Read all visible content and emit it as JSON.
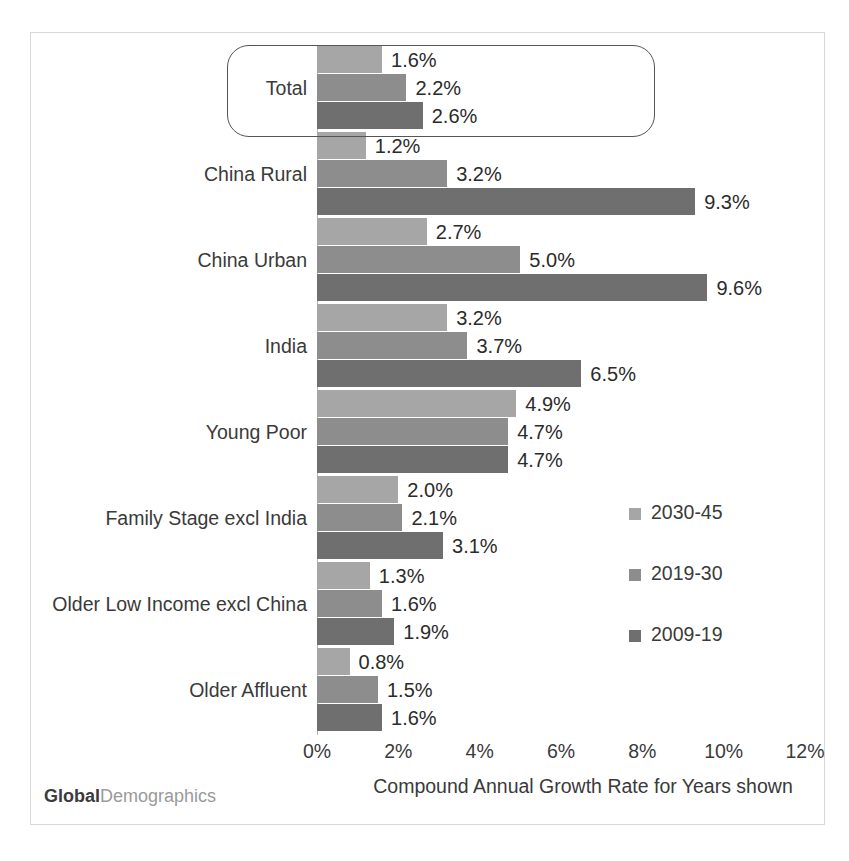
{
  "brand": {
    "bold_part": "Global",
    "light_part": "Demographics"
  },
  "axis": {
    "x_title": "Compound Annual Growth Rate for Years shown",
    "ticks": [
      "0%",
      "2%",
      "4%",
      "6%",
      "8%",
      "10%",
      "12%"
    ]
  },
  "legend": {
    "items": [
      {
        "label": "2030-45",
        "color": "#a6a6a6"
      },
      {
        "label": "2019-30",
        "color": "#8d8d8d"
      },
      {
        "label": "2009-19",
        "color": "#6f6f6f"
      }
    ]
  },
  "highlight": {
    "category": "Total"
  },
  "chart_data": {
    "type": "bar",
    "orientation": "horizontal",
    "title": "",
    "xlabel": "Compound Annual Growth Rate for Years shown",
    "ylabel": "",
    "xlim": [
      0,
      12
    ],
    "xticks": [
      0,
      2,
      4,
      6,
      8,
      10,
      12
    ],
    "xtick_labels": [
      "0%",
      "2%",
      "4%",
      "6%",
      "8%",
      "10%",
      "12%"
    ],
    "grid": false,
    "legend_position": "middle-right",
    "categories": [
      "Total",
      "China Rural",
      "China Urban",
      "India",
      "Young Poor",
      "Family Stage  excl India",
      "Older Low Income excl China",
      "Older Affluent"
    ],
    "series": [
      {
        "name": "2030-45",
        "color": "#a6a6a6",
        "values": [
          1.6,
          1.2,
          2.7,
          3.2,
          4.9,
          2.0,
          1.3,
          0.8
        ],
        "labels": [
          "1.6%",
          "1.2%",
          "2.7%",
          "3.2%",
          "4.9%",
          "2.0%",
          "1.3%",
          "0.8%"
        ]
      },
      {
        "name": "2019-30",
        "color": "#8d8d8d",
        "values": [
          2.2,
          3.2,
          5.0,
          3.7,
          4.7,
          2.1,
          1.6,
          1.5
        ],
        "labels": [
          "2.2%",
          "3.2%",
          "5.0%",
          "3.7%",
          "4.7%",
          "2.1%",
          "1.6%",
          "1.5%"
        ]
      },
      {
        "name": "2009-19",
        "color": "#6f6f6f",
        "values": [
          2.6,
          9.3,
          9.6,
          6.5,
          4.7,
          3.1,
          1.9,
          1.6
        ],
        "labels": [
          "2.6%",
          "9.3%",
          "9.6%",
          "6.5%",
          "4.7%",
          "3.1%",
          "1.9%",
          "1.6%"
        ]
      }
    ]
  }
}
